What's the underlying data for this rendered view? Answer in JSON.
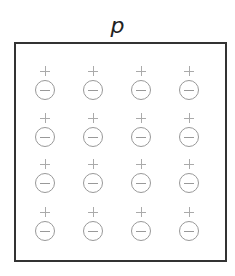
{
  "diagram": {
    "title": "p",
    "grid": {
      "rows": 4,
      "cols": 4
    },
    "columns_x": [
      45,
      93,
      141,
      189
    ],
    "rows_y": [
      66,
      113,
      159,
      207
    ],
    "charge_pair": {
      "top": "+",
      "bottom": "−"
    },
    "colors": {
      "border": "#333333",
      "charges": "#999999",
      "title": "#222222"
    }
  }
}
